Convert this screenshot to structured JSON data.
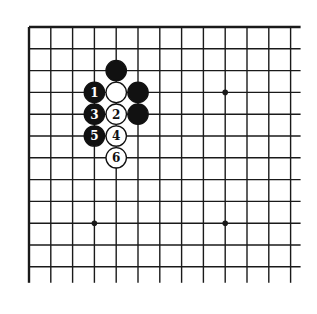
{
  "board": {
    "type": "go-diagram",
    "origin_x": 29,
    "origin_y": 27,
    "spacing": 21.8,
    "columns": 13,
    "rows": 12,
    "line_extend_right": 10,
    "line_extend_bottom": 16,
    "line_color": "#1a1a1a",
    "border_top": true,
    "border_left": true,
    "star_points": [
      {
        "col": 9,
        "row": 3
      },
      {
        "col": 3,
        "row": 9
      },
      {
        "col": 9,
        "row": 9
      }
    ]
  },
  "stones": [
    {
      "col": 4,
      "row": 2,
      "color": "black",
      "label": ""
    },
    {
      "col": 3,
      "row": 3,
      "color": "black",
      "label": "1"
    },
    {
      "col": 4,
      "row": 3,
      "color": "white",
      "label": ""
    },
    {
      "col": 5,
      "row": 3,
      "color": "black",
      "label": ""
    },
    {
      "col": 3,
      "row": 4,
      "color": "black",
      "label": "3"
    },
    {
      "col": 4,
      "row": 4,
      "color": "white",
      "label": "2"
    },
    {
      "col": 5,
      "row": 4,
      "color": "black",
      "label": ""
    },
    {
      "col": 3,
      "row": 5,
      "color": "black",
      "label": "5"
    },
    {
      "col": 4,
      "row": 5,
      "color": "white",
      "label": "4"
    },
    {
      "col": 4,
      "row": 6,
      "color": "white",
      "label": "6"
    }
  ],
  "colors": {
    "black_stone": "#111111",
    "white_stone": "#ffffff",
    "stone_outline": "#111111"
  }
}
